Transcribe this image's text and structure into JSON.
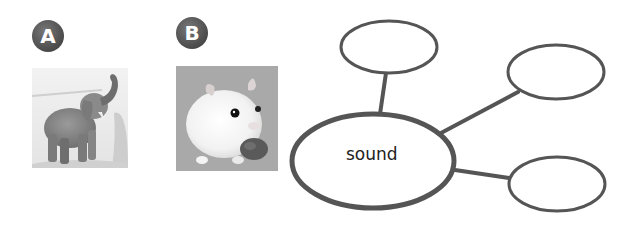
{
  "items": [
    {
      "badge": "A",
      "subject": "elephant"
    },
    {
      "badge": "B",
      "subject": "hamster"
    }
  ],
  "concept_map": {
    "center": {
      "label": "sound"
    },
    "branches": [
      {
        "label": ""
      },
      {
        "label": ""
      },
      {
        "label": ""
      }
    ],
    "stroke_color": "#555555"
  }
}
